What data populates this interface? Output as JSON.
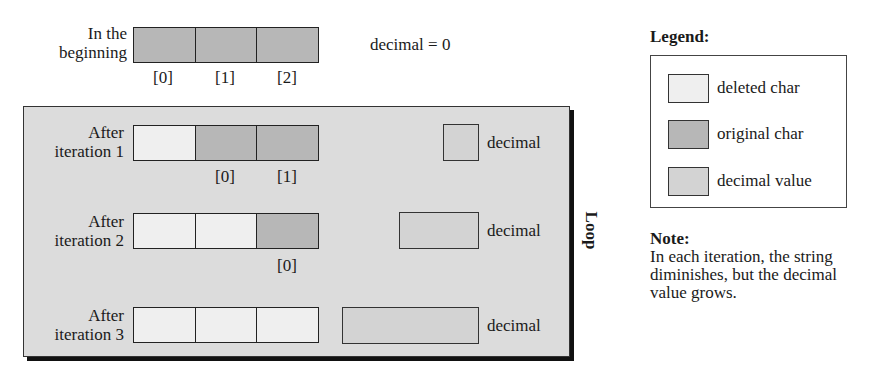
{
  "colors": {
    "deleted_char": "#efefef",
    "original_char": "#b7b7b7",
    "decimal_value": "#d3d3d3",
    "loop_background": "#dcdcdc"
  },
  "initial": {
    "label_line1": "In the",
    "label_line2": "beginning",
    "cells": [
      "original",
      "original",
      "original"
    ],
    "indices": [
      "[0]",
      "[1]",
      "[2]"
    ],
    "decimal_text": "decimal = 0"
  },
  "loop": {
    "label": "Loop",
    "iterations": [
      {
        "label_line1": "After",
        "label_line2": "iteration 1",
        "cells": [
          "deleted",
          "original",
          "original"
        ],
        "indices": [
          "[0]",
          "[1]"
        ],
        "decimal_label": "decimal"
      },
      {
        "label_line1": "After",
        "label_line2": "iteration 2",
        "cells": [
          "deleted",
          "deleted",
          "original"
        ],
        "indices": [
          "[0]"
        ],
        "decimal_label": "decimal"
      },
      {
        "label_line1": "After",
        "label_line2": "iteration 3",
        "cells": [
          "deleted",
          "deleted",
          "deleted"
        ],
        "indices": [],
        "decimal_label": "decimal"
      }
    ]
  },
  "legend": {
    "title": "Legend:",
    "items": [
      {
        "label": "deleted char",
        "swatch": "deleted_char"
      },
      {
        "label": "original char",
        "swatch": "original_char"
      },
      {
        "label": "decimal value",
        "swatch": "decimal_value"
      }
    ]
  },
  "note": {
    "title": "Note:",
    "line1": "In each iteration, the string",
    "line2": "diminishes, but the decimal",
    "line3": "value grows."
  }
}
